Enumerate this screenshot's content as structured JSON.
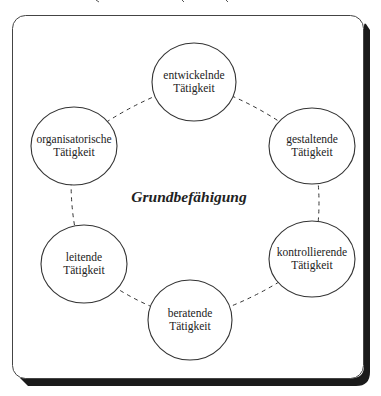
{
  "diagram": {
    "center_label": "Grundbefähigung",
    "nodes": [
      {
        "id": "entwickelnde",
        "line1": "entwickelnde",
        "line2": "Tätigkeit"
      },
      {
        "id": "gestaltende",
        "line1": "gestaltende",
        "line2": "Tätigkeit"
      },
      {
        "id": "kontrollierende",
        "line1": "kontrollierende",
        "line2": "Tätigkeit"
      },
      {
        "id": "beratende",
        "line1": "beratende",
        "line2": "Tätigkeit"
      },
      {
        "id": "leitende",
        "line1": "leitende",
        "line2": "Tätigkeit"
      },
      {
        "id": "organisatorische",
        "line1": "organisatorische",
        "line2": "Tätigkeit"
      }
    ],
    "connections": [
      [
        "entwickelnde",
        "gestaltende"
      ],
      [
        "gestaltende",
        "kontrollierende"
      ],
      [
        "kontrollierende",
        "beratende"
      ],
      [
        "beratende",
        "leitende"
      ],
      [
        "leitende",
        "organisatorische"
      ],
      [
        "organisatorische",
        "entwickelnde"
      ]
    ],
    "colors": {
      "stroke": "#333333",
      "shadow": "#1a1a1a",
      "background": "#ffffff",
      "text": "#222222"
    }
  }
}
